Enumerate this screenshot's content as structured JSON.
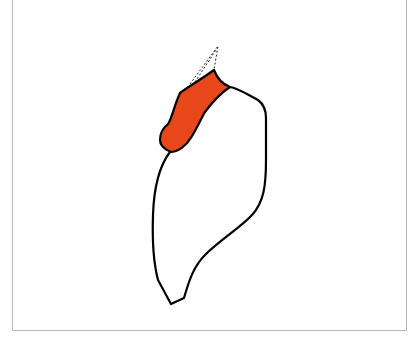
{
  "diagram": {
    "type": "anatomical-outline",
    "colors": {
      "highlight_fill": "#e8471a",
      "outline": "#000000",
      "frame_border": "#b5b5b5",
      "background": "#ffffff"
    },
    "regions": [
      {
        "name": "highlighted-upper-region",
        "fill": "#e8471a"
      },
      {
        "name": "main-body-region",
        "fill": "#ffffff"
      },
      {
        "name": "dashed-extension",
        "style": "dashed"
      }
    ]
  }
}
